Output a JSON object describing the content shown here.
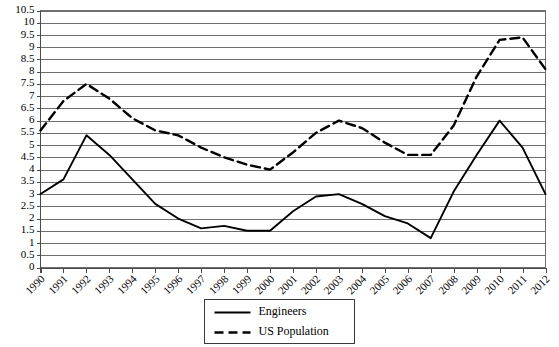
{
  "chart_data": {
    "type": "line",
    "title": "",
    "subtitle": "",
    "xlabel": "",
    "ylabel": "",
    "x": [
      1990,
      1991,
      1992,
      1993,
      1994,
      1995,
      1996,
      1997,
      1998,
      1999,
      2000,
      2001,
      2002,
      2003,
      2004,
      2005,
      2006,
      2007,
      2008,
      2009,
      2010,
      2011,
      2012
    ],
    "categories": [
      "1990",
      "1991",
      "1992",
      "1993",
      "1994",
      "1995",
      "1996",
      "1997",
      "1998",
      "1999",
      "2000",
      "2001",
      "2002",
      "2003",
      "2004",
      "2005",
      "2006",
      "2007",
      "2008",
      "2009",
      "2010",
      "2011",
      "2012"
    ],
    "series": [
      {
        "name": "Engineers",
        "style": "solid",
        "color": "#000000",
        "values": [
          3.0,
          3.6,
          5.4,
          4.6,
          3.6,
          2.6,
          2.0,
          1.6,
          1.7,
          1.5,
          1.5,
          2.3,
          2.9,
          3.0,
          2.6,
          2.1,
          1.8,
          1.2,
          3.1,
          4.6,
          6.0,
          4.9,
          3.0
        ]
      },
      {
        "name": "US Population",
        "style": "dashed",
        "color": "#000000",
        "values": [
          5.6,
          6.8,
          7.5,
          6.9,
          6.1,
          5.6,
          5.4,
          4.9,
          4.5,
          4.2,
          4.0,
          4.7,
          5.5,
          6.0,
          5.7,
          5.1,
          4.6,
          4.6,
          5.8,
          7.8,
          9.3,
          9.4,
          8.1
        ]
      }
    ],
    "y_ticks": [
      "0",
      "0.5",
      "1",
      "1.5",
      "2",
      "2.5",
      "3",
      "3.5",
      "4",
      "4.5",
      "5",
      "5.5",
      "6",
      "6.5",
      "7",
      "7.5",
      "8",
      "8.5",
      "9",
      "9.5",
      "10",
      "10.5"
    ],
    "ylim": [
      0,
      10.5
    ],
    "y_tick_step": 0.5,
    "grid": true,
    "grid_axis": "y",
    "legend": {
      "position": "bottom-center",
      "entries": [
        {
          "label": "Engineers",
          "style": "solid"
        },
        {
          "label": "US Population",
          "style": "dashed"
        }
      ]
    }
  }
}
